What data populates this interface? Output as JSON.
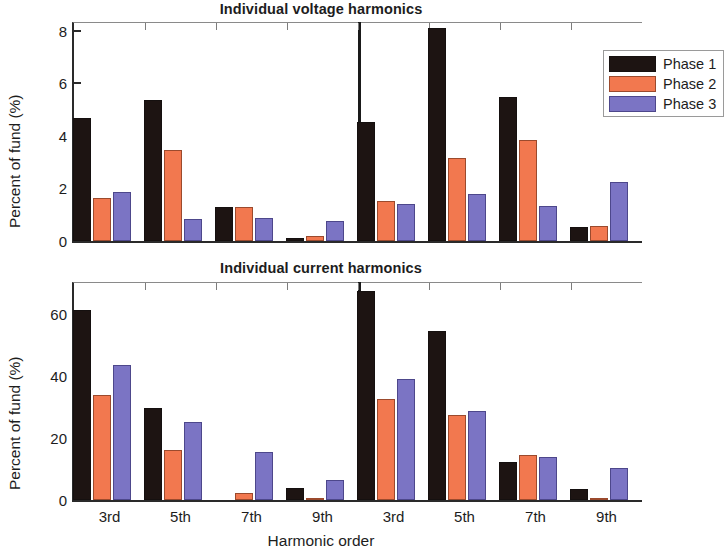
{
  "figure": {
    "xlabel": "Harmonic order",
    "ylabel": "Percent of fund (%)"
  },
  "legend": {
    "position": "top-right",
    "entries": [
      {
        "label": "Phase 1",
        "color": "#1d1412"
      },
      {
        "label": "Phase 2",
        "color": "#f2784f"
      },
      {
        "label": "Phase 3",
        "color": "#7b74c4"
      }
    ]
  },
  "chart_data": [
    {
      "type": "bar",
      "title": "Individual voltage harmonics",
      "xlabel": "Harmonic order",
      "ylabel": "Percent of fund (%)",
      "ylim": [
        0,
        8.3
      ],
      "yticks": [
        0,
        2,
        4,
        6,
        8
      ],
      "grid": false,
      "categories": [
        "3rd",
        "5th",
        "7th",
        "9th",
        "3rd",
        "5th",
        "7th",
        "9th"
      ],
      "group_divider_after_index": 3,
      "series": [
        {
          "name": "Phase 1",
          "color": "#1d1412",
          "values": [
            4.7,
            5.35,
            1.28,
            0.12,
            4.55,
            8.1,
            5.5,
            0.55
          ]
        },
        {
          "name": "Phase 2",
          "color": "#f2784f",
          "values": [
            1.62,
            3.48,
            1.28,
            0.18,
            1.53,
            3.15,
            3.85,
            0.58
          ]
        },
        {
          "name": "Phase 3",
          "color": "#7b74c4",
          "values": [
            1.85,
            0.85,
            0.87,
            0.78,
            1.4,
            1.78,
            1.35,
            2.25
          ]
        }
      ]
    },
    {
      "type": "bar",
      "title": "Individual current harmonics",
      "xlabel": "Harmonic order",
      "ylabel": "Percent of fund (%)",
      "ylim": [
        0,
        70
      ],
      "yticks": [
        0,
        20,
        40,
        60
      ],
      "grid": false,
      "categories": [
        "3rd",
        "5th",
        "7th",
        "9th",
        "3rd",
        "5th",
        "7th",
        "9th"
      ],
      "group_divider_after_index": 3,
      "series": [
        {
          "name": "Phase 1",
          "color": "#1d1412",
          "values": [
            61.3,
            29.6,
            0,
            3.8,
            67.5,
            54.4,
            12.4,
            3.5
          ]
        },
        {
          "name": "Phase 2",
          "color": "#f2784f",
          "values": [
            34.0,
            16.2,
            2.4,
            0.3,
            32.5,
            27.5,
            14.5,
            0.35
          ]
        },
        {
          "name": "Phase 3",
          "color": "#7b74c4",
          "values": [
            43.5,
            25.2,
            15.5,
            6.3,
            39.0,
            28.6,
            14.0,
            10.2
          ]
        }
      ]
    }
  ]
}
